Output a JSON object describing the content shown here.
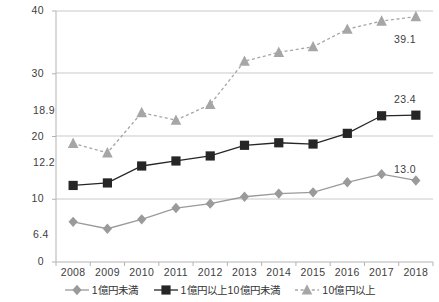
{
  "chart_data": {
    "type": "line",
    "title": "",
    "subtitle": "",
    "xlabel": "",
    "ylabel": "",
    "categories": [
      "2008",
      "2009",
      "2010",
      "2011",
      "2012",
      "2013",
      "2014",
      "2015",
      "2016",
      "2017",
      "2018"
    ],
    "ylim": [
      0,
      40
    ],
    "yticks": [
      "0",
      "10",
      "20",
      "30",
      "40"
    ],
    "grid": true,
    "legend_position": "bottom",
    "series": [
      {
        "name": "1億円未満",
        "marker": "diamond",
        "color": "#9a9a9a",
        "linestyle": "solid",
        "values": [
          6.4,
          5.3,
          6.8,
          8.6,
          9.3,
          10.4,
          10.9,
          11.1,
          12.7,
          14.0,
          13.0
        ],
        "labels": [
          {
            "category": "2008",
            "value": "6.4"
          },
          {
            "category": "2018",
            "value": "13.0"
          }
        ]
      },
      {
        "name": "1億円以上10億円未満",
        "marker": "square",
        "color": "#262626",
        "linestyle": "solid",
        "values": [
          12.2,
          12.6,
          15.3,
          16.1,
          16.9,
          18.6,
          19.0,
          18.8,
          20.5,
          23.3,
          23.4
        ],
        "labels": [
          {
            "category": "2008",
            "value": "12.2"
          },
          {
            "category": "2018",
            "value": "23.4"
          }
        ]
      },
      {
        "name": "10億円以上",
        "marker": "triangle",
        "color": "#a6a6a6",
        "linestyle": "dashed",
        "values": [
          18.9,
          17.4,
          23.8,
          22.6,
          25.1,
          32.0,
          33.4,
          34.3,
          37.1,
          38.4,
          39.1
        ],
        "labels": [
          {
            "category": "2008",
            "value": "18.9"
          },
          {
            "category": "2018",
            "value": "39.1"
          }
        ]
      }
    ]
  },
  "axis": {
    "y_ticks": [
      "40",
      "30",
      "20",
      "10",
      "0"
    ],
    "x_ticks": [
      "2008",
      "2009",
      "2010",
      "2011",
      "2012",
      "2013",
      "2014",
      "2015",
      "2016",
      "2017",
      "2018"
    ]
  },
  "labels": {
    "start_top": "18.9",
    "start_mid": "12.2",
    "start_low": "6.4",
    "end_top": "39.1",
    "end_mid": "23.4",
    "end_low": "13.0"
  },
  "legend": {
    "items": [
      {
        "label": "1億円未満",
        "marker": "diamond",
        "color": "#9a9a9a",
        "linestyle": "solid"
      },
      {
        "label": "1億円以上10億円未満",
        "marker": "square",
        "color": "#262626",
        "linestyle": "solid"
      },
      {
        "label": "10億円以上",
        "marker": "triangle",
        "color": "#a6a6a6",
        "linestyle": "dashed"
      }
    ]
  },
  "colors": {
    "grid": "#c9c9c9",
    "axis": "#b3b3b3",
    "text": "#3d3d3d",
    "series_low": "#9a9a9a",
    "series_mid": "#262626",
    "series_high": "#a6a6a6"
  }
}
